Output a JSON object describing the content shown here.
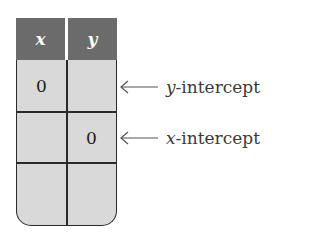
{
  "table": {
    "headers": [
      "x",
      "y"
    ],
    "rows": [
      [
        "0",
        ""
      ],
      [
        "",
        "0"
      ],
      [
        "",
        ""
      ]
    ]
  },
  "annotations": [
    {
      "row": 0,
      "var": "y",
      "text": "-intercept",
      "icon": "left-arrow-icon"
    },
    {
      "row": 1,
      "var": "x",
      "text": "-intercept",
      "icon": "left-arrow-icon"
    }
  ],
  "colors": {
    "header_bg": "#6b6b6b",
    "cell_bg": "#d9d9d9",
    "border": "#2a2a2a",
    "label_text": "#3a3a3a"
  }
}
